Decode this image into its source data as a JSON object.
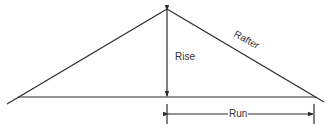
{
  "diagram": {
    "labels": {
      "rise": "Rise",
      "rafter": "Rafter",
      "run": "Run"
    },
    "colors": {
      "stroke": "#2a2a2a",
      "text": "#333333",
      "background": "#ffffff"
    }
  }
}
